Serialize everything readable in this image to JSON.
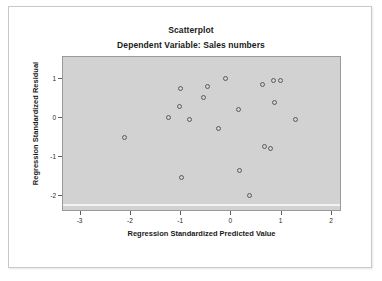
{
  "chart_data": {
    "type": "scatter",
    "title": "Scatterplot",
    "subtitle": "Dependent Variable: Sales numbers",
    "xlabel": "Regression Standardized Predicted Value",
    "ylabel": "Regression Standardized Residual",
    "xlim": [
      -3.35,
      2.2
    ],
    "ylim": [
      -2.4,
      1.55
    ],
    "xticks": [
      -3,
      -2,
      -1,
      0,
      1,
      2
    ],
    "xtick_labels": [
      "-3",
      "-2",
      "-1",
      "0",
      "1",
      "2"
    ],
    "yticks": [
      1,
      0,
      -1,
      -2
    ],
    "ytick_labels": [
      "1",
      "0",
      "-1",
      "-2"
    ],
    "grid": false,
    "legend": null,
    "marker": "open-circle",
    "marker_color": "#5a5a5a",
    "plot_background": "#d2d2d2",
    "points": [
      {
        "x": -2.12,
        "y": -0.49
      },
      {
        "x": -1.02,
        "y": 0.74
      },
      {
        "x": -1.04,
        "y": 0.3
      },
      {
        "x": -1.25,
        "y": 0.01
      },
      {
        "x": -0.83,
        "y": -0.05
      },
      {
        "x": -1.0,
        "y": -1.53
      },
      {
        "x": -0.55,
        "y": 0.52
      },
      {
        "x": -0.47,
        "y": 0.79
      },
      {
        "x": -0.25,
        "y": -0.27
      },
      {
        "x": -0.12,
        "y": 1.01
      },
      {
        "x": 0.14,
        "y": 0.22
      },
      {
        "x": 0.16,
        "y": -1.33
      },
      {
        "x": 0.35,
        "y": -1.97
      },
      {
        "x": 0.62,
        "y": 0.85
      },
      {
        "x": 0.66,
        "y": -0.72
      },
      {
        "x": 0.84,
        "y": 0.96
      },
      {
        "x": 0.98,
        "y": 0.96
      },
      {
        "x": 0.77,
        "y": -0.77
      },
      {
        "x": 0.86,
        "y": 0.38
      },
      {
        "x": 1.27,
        "y": -0.03
      }
    ]
  }
}
